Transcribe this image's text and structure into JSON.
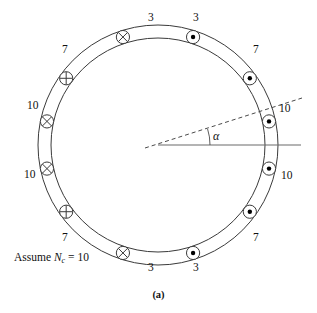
{
  "figure": {
    "caption": "(a)",
    "assume_prefix": "Assume ",
    "assume_symbol": "N",
    "assume_subscript": "c",
    "assume_equals": " = 10",
    "angle_symbol": "α",
    "center": {
      "x": 158,
      "y": 145
    },
    "outer_radius": 120,
    "inner_radius": 107,
    "stroke_color": "#3a3a3a",
    "axis_color": "#6a6a6a"
  },
  "conductors": [
    {
      "label": "3",
      "angle_deg": 72,
      "marker": "dot",
      "label_x": 148,
      "label_y": 12
    },
    {
      "label": "3",
      "angle_deg": 108,
      "marker": "cross",
      "label_x": 193,
      "label_y": 12
    },
    {
      "label": "7",
      "angle_deg": 36,
      "marker": "dot",
      "label_x": 62,
      "label_y": 44
    },
    {
      "label": "7",
      "angle_deg": 144,
      "marker": "plus",
      "label_x": 253,
      "label_y": 44
    },
    {
      "label": "10",
      "angle_deg": 12,
      "marker": "dot",
      "label_x": 27,
      "label_y": 100
    },
    {
      "label": "10",
      "angle_deg": 168,
      "marker": "cross",
      "label_x": 279,
      "label_y": 103
    },
    {
      "label": "10",
      "angle_deg": -12,
      "marker": "dot",
      "label_x": 24,
      "label_y": 169
    },
    {
      "label": "10",
      "angle_deg": 192,
      "marker": "cross",
      "label_x": 281,
      "label_y": 170
    },
    {
      "label": "7",
      "angle_deg": -36,
      "marker": "dot",
      "label_x": 62,
      "label_y": 232
    },
    {
      "label": "7",
      "angle_deg": 216,
      "marker": "plus",
      "label_x": 253,
      "label_y": 232
    },
    {
      "label": "3",
      "angle_deg": -72,
      "marker": "dot",
      "label_x": 148,
      "label_y": 262
    },
    {
      "label": "3",
      "angle_deg": 252,
      "marker": "cross",
      "label_x": 193,
      "label_y": 262
    }
  ],
  "lines": {
    "horizontal": {
      "x1": 158,
      "y1": 145,
      "x2": 301,
      "y2": 145
    },
    "dashed": {
      "x1": 145,
      "y1": 148,
      "x2": 302,
      "y2": 98
    },
    "arc_radius": 52
  }
}
